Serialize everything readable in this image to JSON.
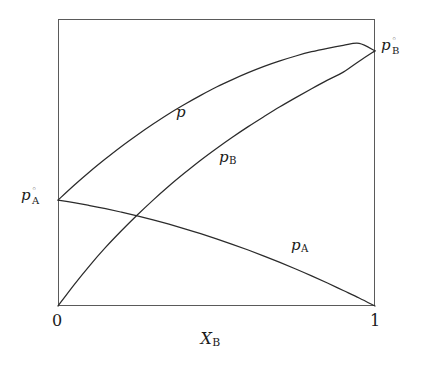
{
  "figure": {
    "background_color": "#ffffff",
    "line_color": "#2b2b2b",
    "frame_color": "#5a5a5a"
  },
  "axes": {
    "x_label_symbol": "X",
    "x_label_sub": "B",
    "x_ticks": [
      "0",
      "1"
    ],
    "tick_left": "0",
    "tick_right": "1"
  },
  "labels": {
    "p_total": {
      "symbol": "p",
      "sub": "",
      "sup": ""
    },
    "p_B": {
      "symbol": "p",
      "sub": "B",
      "sup": ""
    },
    "p_A": {
      "symbol": "p",
      "sub": "A",
      "sup": ""
    },
    "p0_B": {
      "symbol": "p",
      "sub": "B",
      "sup": "◦"
    },
    "p0_A": {
      "symbol": "p",
      "sub": "A",
      "sup": "◦"
    }
  },
  "chart_data": {
    "type": "line",
    "title": "",
    "subtitle": "",
    "xlabel": "X_B",
    "ylabel": "",
    "xlim": [
      0,
      1
    ],
    "ylim": [
      0,
      1
    ],
    "grid": false,
    "legend": "inline-curve-labels",
    "axis_ticks_x": [
      {
        "value": 0,
        "label": "0"
      },
      {
        "value": 1,
        "label": "1"
      }
    ],
    "axis_ticks_y": [],
    "annotations": [
      {
        "text": "p",
        "x": 0.37,
        "y": 0.68,
        "note": "total vapour pressure curve label"
      },
      {
        "text": "p_B",
        "x": 0.52,
        "y": 0.52,
        "note": "partial pressure of B label"
      },
      {
        "text": "p_A",
        "x": 0.74,
        "y": 0.22,
        "note": "partial pressure of A label"
      },
      {
        "text": "p°_B",
        "x": 1.02,
        "y": 0.89,
        "note": "pure B vapour pressure, right axis"
      },
      {
        "text": "p°_A",
        "x": -0.12,
        "y": 0.37,
        "note": "pure A vapour pressure, left axis"
      }
    ],
    "series": [
      {
        "name": "p",
        "label": "p",
        "description": "total vapour pressure, positive deviation from Raoult's law, concave down from p0_A to p0_B",
        "x": [
          0.0,
          0.05,
          0.1,
          0.15,
          0.2,
          0.25,
          0.3,
          0.35,
          0.4,
          0.45,
          0.5,
          0.55,
          0.6,
          0.65,
          0.7,
          0.75,
          0.8,
          0.85,
          0.9,
          0.95,
          1.0
        ],
        "y": [
          0.369,
          0.42,
          0.468,
          0.513,
          0.556,
          0.596,
          0.634,
          0.67,
          0.703,
          0.734,
          0.763,
          0.789,
          0.813,
          0.835,
          0.854,
          0.871,
          0.886,
          0.898,
          0.908,
          0.915,
          0.889
        ]
      },
      {
        "name": "p_B",
        "label": "p_B",
        "description": "partial pressure of B, rises from 0 to p0_B, concave down (positive deviation)",
        "x": [
          0.0,
          0.05,
          0.1,
          0.15,
          0.2,
          0.25,
          0.3,
          0.35,
          0.4,
          0.45,
          0.5,
          0.55,
          0.6,
          0.65,
          0.7,
          0.75,
          0.8,
          0.85,
          0.9,
          0.95,
          1.0
        ],
        "y": [
          0.0,
          0.073,
          0.141,
          0.204,
          0.262,
          0.317,
          0.369,
          0.418,
          0.464,
          0.508,
          0.549,
          0.588,
          0.625,
          0.66,
          0.694,
          0.726,
          0.757,
          0.787,
          0.815,
          0.853,
          0.889
        ]
      },
      {
        "name": "p_A",
        "label": "p_A",
        "description": "partial pressure of A, falls from p0_A to 0, concave down (positive deviation)",
        "x": [
          0.0,
          0.05,
          0.1,
          0.15,
          0.2,
          0.25,
          0.3,
          0.35,
          0.4,
          0.45,
          0.5,
          0.55,
          0.6,
          0.65,
          0.7,
          0.75,
          0.8,
          0.85,
          0.9,
          0.95,
          1.0
        ],
        "y": [
          0.369,
          0.36,
          0.35,
          0.339,
          0.327,
          0.314,
          0.3,
          0.285,
          0.269,
          0.252,
          0.234,
          0.215,
          0.195,
          0.174,
          0.152,
          0.129,
          0.105,
          0.08,
          0.054,
          0.028,
          0.0
        ]
      }
    ],
    "intersections": [
      {
        "between": [
          "p_A",
          "p_B"
        ],
        "x": 0.227,
        "y": 0.318
      }
    ]
  }
}
